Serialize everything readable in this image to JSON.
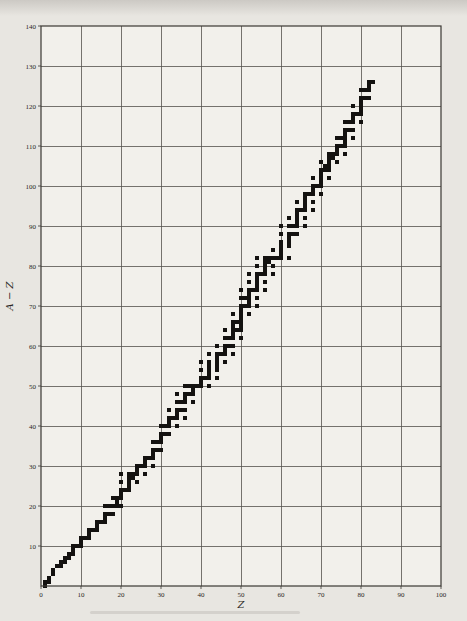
{
  "colors": {
    "paper": "#e8e6e1",
    "plot_background": "#f2f0eb",
    "grid": "#55524e",
    "frame": "#3a3733",
    "marker": "#141210",
    "text": "#2a2724"
  },
  "chart_data": {
    "type": "scatter",
    "title": "",
    "xlabel": "Z",
    "ylabel": "A − Z",
    "series_name": "stable nuclides (neutron number A−Z vs proton number Z)",
    "marker": "filled-square",
    "grid": true,
    "grid_step": 10,
    "xlim": [
      0,
      100
    ],
    "ylim": [
      0,
      140
    ],
    "xticks": [
      0,
      10,
      20,
      30,
      40,
      50,
      60,
      70,
      80,
      90,
      100
    ],
    "yticks": [
      10,
      20,
      30,
      40,
      50,
      60,
      70,
      80,
      90,
      100,
      110,
      120,
      130,
      140
    ],
    "legend": "none",
    "points": [
      [
        1,
        0
      ],
      [
        1,
        1
      ],
      [
        2,
        1
      ],
      [
        2,
        2
      ],
      [
        3,
        3
      ],
      [
        3,
        4
      ],
      [
        4,
        5
      ],
      [
        5,
        5
      ],
      [
        5,
        6
      ],
      [
        6,
        6
      ],
      [
        6,
        7
      ],
      [
        7,
        7
      ],
      [
        7,
        8
      ],
      [
        8,
        8
      ],
      [
        8,
        9
      ],
      [
        8,
        10
      ],
      [
        9,
        10
      ],
      [
        10,
        10
      ],
      [
        10,
        11
      ],
      [
        10,
        12
      ],
      [
        11,
        12
      ],
      [
        12,
        12
      ],
      [
        12,
        13
      ],
      [
        12,
        14
      ],
      [
        13,
        14
      ],
      [
        14,
        14
      ],
      [
        14,
        15
      ],
      [
        14,
        16
      ],
      [
        15,
        16
      ],
      [
        16,
        16
      ],
      [
        16,
        17
      ],
      [
        16,
        18
      ],
      [
        16,
        20
      ],
      [
        17,
        18
      ],
      [
        17,
        20
      ],
      [
        18,
        18
      ],
      [
        18,
        20
      ],
      [
        18,
        22
      ],
      [
        19,
        20
      ],
      [
        19,
        21
      ],
      [
        19,
        22
      ],
      [
        20,
        20
      ],
      [
        20,
        22
      ],
      [
        20,
        23
      ],
      [
        20,
        24
      ],
      [
        20,
        26
      ],
      [
        20,
        28
      ],
      [
        21,
        24
      ],
      [
        22,
        24
      ],
      [
        22,
        25
      ],
      [
        22,
        26
      ],
      [
        22,
        27
      ],
      [
        22,
        28
      ],
      [
        23,
        27
      ],
      [
        23,
        28
      ],
      [
        24,
        26
      ],
      [
        24,
        28
      ],
      [
        24,
        29
      ],
      [
        24,
        30
      ],
      [
        25,
        30
      ],
      [
        26,
        28
      ],
      [
        26,
        30
      ],
      [
        26,
        31
      ],
      [
        26,
        32
      ],
      [
        27,
        32
      ],
      [
        28,
        30
      ],
      [
        28,
        32
      ],
      [
        28,
        33
      ],
      [
        28,
        34
      ],
      [
        28,
        36
      ],
      [
        29,
        34
      ],
      [
        29,
        36
      ],
      [
        30,
        34
      ],
      [
        30,
        36
      ],
      [
        30,
        37
      ],
      [
        30,
        38
      ],
      [
        30,
        40
      ],
      [
        31,
        38
      ],
      [
        31,
        40
      ],
      [
        32,
        38
      ],
      [
        32,
        40
      ],
      [
        32,
        41
      ],
      [
        32,
        42
      ],
      [
        32,
        44
      ],
      [
        33,
        42
      ],
      [
        34,
        40
      ],
      [
        34,
        42
      ],
      [
        34,
        43
      ],
      [
        34,
        44
      ],
      [
        34,
        46
      ],
      [
        34,
        48
      ],
      [
        35,
        44
      ],
      [
        35,
        46
      ],
      [
        36,
        42
      ],
      [
        36,
        44
      ],
      [
        36,
        46
      ],
      [
        36,
        47
      ],
      [
        36,
        48
      ],
      [
        36,
        50
      ],
      [
        37,
        48
      ],
      [
        37,
        50
      ],
      [
        38,
        46
      ],
      [
        38,
        48
      ],
      [
        38,
        49
      ],
      [
        38,
        50
      ],
      [
        39,
        50
      ],
      [
        40,
        50
      ],
      [
        40,
        51
      ],
      [
        40,
        52
      ],
      [
        40,
        54
      ],
      [
        40,
        56
      ],
      [
        41,
        52
      ],
      [
        42,
        50
      ],
      [
        42,
        52
      ],
      [
        42,
        53
      ],
      [
        42,
        54
      ],
      [
        42,
        55
      ],
      [
        42,
        56
      ],
      [
        42,
        58
      ],
      [
        44,
        52
      ],
      [
        44,
        54
      ],
      [
        44,
        55
      ],
      [
        44,
        56
      ],
      [
        44,
        57
      ],
      [
        44,
        58
      ],
      [
        44,
        60
      ],
      [
        45,
        58
      ],
      [
        46,
        56
      ],
      [
        46,
        58
      ],
      [
        46,
        59
      ],
      [
        46,
        60
      ],
      [
        46,
        62
      ],
      [
        46,
        64
      ],
      [
        47,
        60
      ],
      [
        47,
        62
      ],
      [
        48,
        58
      ],
      [
        48,
        60
      ],
      [
        48,
        62
      ],
      [
        48,
        63
      ],
      [
        48,
        64
      ],
      [
        48,
        65
      ],
      [
        48,
        66
      ],
      [
        48,
        68
      ],
      [
        49,
        64
      ],
      [
        49,
        66
      ],
      [
        50,
        62
      ],
      [
        50,
        64
      ],
      [
        50,
        65
      ],
      [
        50,
        66
      ],
      [
        50,
        67
      ],
      [
        50,
        68
      ],
      [
        50,
        69
      ],
      [
        50,
        70
      ],
      [
        50,
        72
      ],
      [
        50,
        74
      ],
      [
        51,
        70
      ],
      [
        51,
        72
      ],
      [
        52,
        68
      ],
      [
        52,
        70
      ],
      [
        52,
        71
      ],
      [
        52,
        72
      ],
      [
        52,
        73
      ],
      [
        52,
        74
      ],
      [
        52,
        76
      ],
      [
        52,
        78
      ],
      [
        53,
        74
      ],
      [
        54,
        70
      ],
      [
        54,
        72
      ],
      [
        54,
        74
      ],
      [
        54,
        75
      ],
      [
        54,
        76
      ],
      [
        54,
        77
      ],
      [
        54,
        78
      ],
      [
        54,
        80
      ],
      [
        54,
        82
      ],
      [
        55,
        78
      ],
      [
        56,
        74
      ],
      [
        56,
        76
      ],
      [
        56,
        78
      ],
      [
        56,
        79
      ],
      [
        56,
        80
      ],
      [
        56,
        81
      ],
      [
        56,
        82
      ],
      [
        57,
        81
      ],
      [
        57,
        82
      ],
      [
        58,
        78
      ],
      [
        58,
        80
      ],
      [
        58,
        82
      ],
      [
        58,
        84
      ],
      [
        59,
        82
      ],
      [
        60,
        82
      ],
      [
        60,
        83
      ],
      [
        60,
        84
      ],
      [
        60,
        85
      ],
      [
        60,
        86
      ],
      [
        60,
        88
      ],
      [
        60,
        90
      ],
      [
        62,
        82
      ],
      [
        62,
        85
      ],
      [
        62,
        86
      ],
      [
        62,
        87
      ],
      [
        62,
        88
      ],
      [
        62,
        90
      ],
      [
        62,
        92
      ],
      [
        63,
        88
      ],
      [
        63,
        90
      ],
      [
        64,
        88
      ],
      [
        64,
        90
      ],
      [
        64,
        91
      ],
      [
        64,
        92
      ],
      [
        64,
        93
      ],
      [
        64,
        94
      ],
      [
        64,
        96
      ],
      [
        65,
        94
      ],
      [
        66,
        90
      ],
      [
        66,
        92
      ],
      [
        66,
        94
      ],
      [
        66,
        95
      ],
      [
        66,
        96
      ],
      [
        66,
        97
      ],
      [
        66,
        98
      ],
      [
        67,
        98
      ],
      [
        68,
        94
      ],
      [
        68,
        96
      ],
      [
        68,
        98
      ],
      [
        68,
        99
      ],
      [
        68,
        100
      ],
      [
        68,
        102
      ],
      [
        69,
        100
      ],
      [
        70,
        98
      ],
      [
        70,
        100
      ],
      [
        70,
        101
      ],
      [
        70,
        102
      ],
      [
        70,
        103
      ],
      [
        70,
        104
      ],
      [
        70,
        106
      ],
      [
        71,
        104
      ],
      [
        71,
        105
      ],
      [
        72,
        102
      ],
      [
        72,
        104
      ],
      [
        72,
        105
      ],
      [
        72,
        106
      ],
      [
        72,
        107
      ],
      [
        72,
        108
      ],
      [
        73,
        107
      ],
      [
        73,
        108
      ],
      [
        74,
        106
      ],
      [
        74,
        108
      ],
      [
        74,
        109
      ],
      [
        74,
        110
      ],
      [
        74,
        112
      ],
      [
        75,
        110
      ],
      [
        75,
        112
      ],
      [
        76,
        108
      ],
      [
        76,
        110
      ],
      [
        76,
        111
      ],
      [
        76,
        112
      ],
      [
        76,
        113
      ],
      [
        76,
        114
      ],
      [
        76,
        116
      ],
      [
        77,
        114
      ],
      [
        77,
        116
      ],
      [
        78,
        112
      ],
      [
        78,
        114
      ],
      [
        78,
        116
      ],
      [
        78,
        117
      ],
      [
        78,
        118
      ],
      [
        78,
        120
      ],
      [
        79,
        118
      ],
      [
        80,
        116
      ],
      [
        80,
        118
      ],
      [
        80,
        119
      ],
      [
        80,
        120
      ],
      [
        80,
        121
      ],
      [
        80,
        122
      ],
      [
        80,
        124
      ],
      [
        81,
        122
      ],
      [
        81,
        124
      ],
      [
        82,
        122
      ],
      [
        82,
        124
      ],
      [
        82,
        125
      ],
      [
        82,
        126
      ],
      [
        83,
        126
      ]
    ]
  }
}
